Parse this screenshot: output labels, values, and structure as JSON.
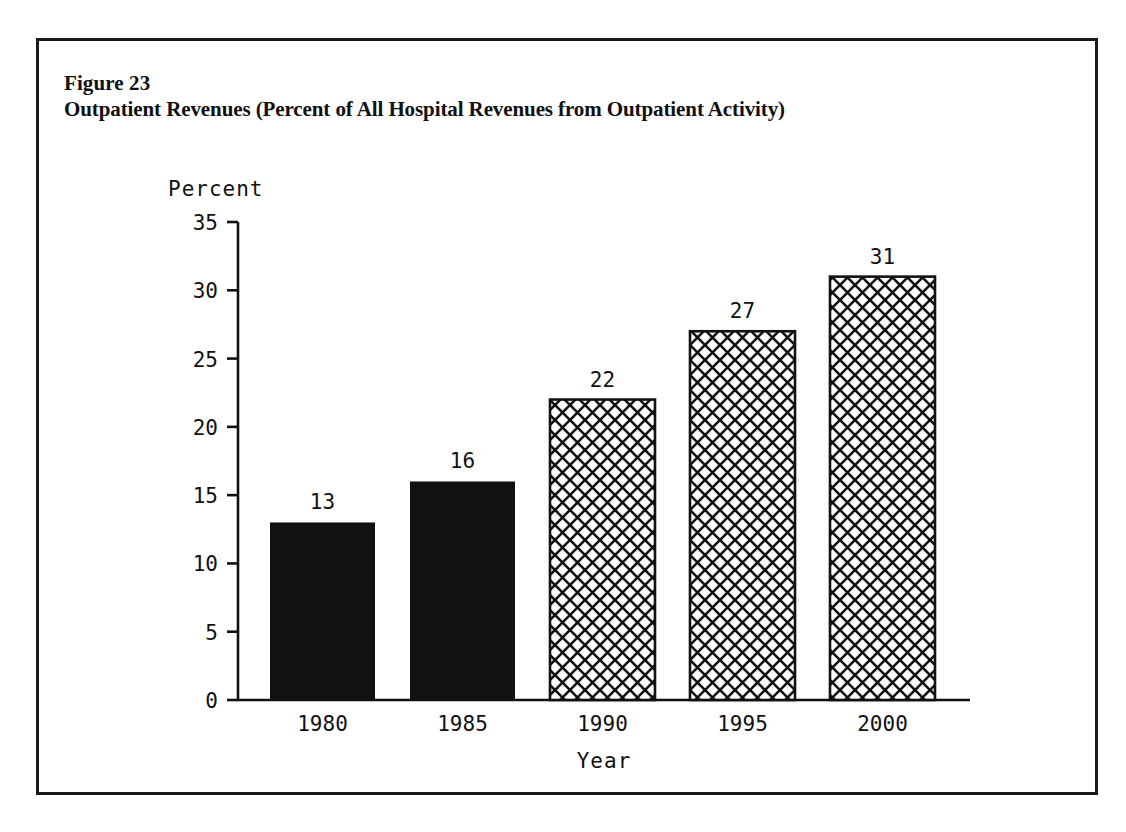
{
  "figure": {
    "label": "Figure 23",
    "title": "Outpatient Revenues (Percent of All Hospital Revenues from Outpatient Activity)"
  },
  "chart_data": {
    "type": "bar",
    "title": "Outpatient Revenues (Percent of All Hospital Revenues from Outpatient Activity)",
    "categories": [
      "1980",
      "1985",
      "1990",
      "1995",
      "2000"
    ],
    "values": [
      13,
      16,
      22,
      27,
      31
    ],
    "xlabel": "Year",
    "ylabel": "Percent",
    "ylim": [
      0,
      35
    ],
    "yticks": [
      0,
      5,
      10,
      15,
      20,
      25,
      30,
      35
    ],
    "ytick_labels": [
      "0",
      "5",
      "10",
      "15",
      "20",
      "25",
      "30",
      "35"
    ],
    "grid": false,
    "legend": false,
    "data_labels": [
      "13",
      "16",
      "22",
      "27",
      "31"
    ],
    "bar_styles": [
      "solid-black",
      "solid-black",
      "crosshatch",
      "crosshatch",
      "crosshatch"
    ],
    "colors": {
      "bar_solid": "#111111",
      "bar_hatch_line": "#111111",
      "bar_hatch_fill": "#ffffff",
      "axis": "#111111",
      "text": "#111111",
      "background": "#ffffff",
      "frame": "#1a1a1a"
    }
  }
}
